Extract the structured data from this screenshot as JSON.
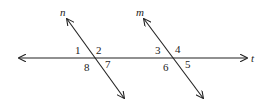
{
  "diagram": {
    "lines": {
      "t": {
        "label": "t"
      },
      "n": {
        "label": "n"
      },
      "m": {
        "label": "m"
      }
    },
    "angles": {
      "a1": "1",
      "a2": "2",
      "a7": "7",
      "a8": "8",
      "a3": "3",
      "a4": "4",
      "a5": "5",
      "a6": "6"
    },
    "colors": {
      "stroke": "#222222",
      "background": "#ffffff"
    }
  }
}
